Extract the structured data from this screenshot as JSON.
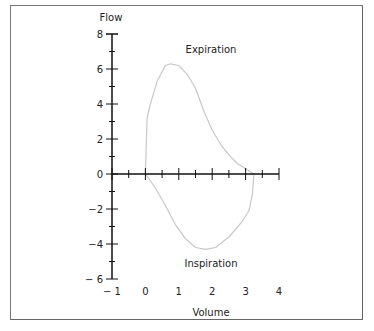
{
  "chart_data": {
    "type": "line",
    "title": "",
    "xlabel": "Volume",
    "ylabel": "Flow",
    "xlim": [
      -1,
      4
    ],
    "ylim": [
      -6,
      8
    ],
    "grid": false,
    "x_ticks": [
      "− 1",
      "0",
      "1",
      "2",
      "3",
      "4"
    ],
    "y_ticks": [
      "8",
      "6",
      "4",
      "2",
      "0",
      "−2",
      "−4",
      "− 6"
    ],
    "annotations": [
      {
        "text": "Expiration",
        "x": 2.0,
        "y": 7.1
      },
      {
        "text": "Inspiration",
        "x": 2.0,
        "y": -5.1
      }
    ],
    "series": [
      {
        "name": "Expiration",
        "x": [
          0.0,
          0.05,
          0.15,
          0.35,
          0.6,
          0.75,
          1.0,
          1.25,
          1.5,
          1.75,
          2.0,
          2.25,
          2.5,
          2.75,
          3.0,
          3.25
        ],
        "y": [
          0.0,
          3.2,
          4.0,
          5.3,
          6.2,
          6.3,
          6.2,
          5.7,
          4.9,
          3.6,
          2.5,
          1.7,
          1.1,
          0.6,
          0.3,
          0.0
        ]
      },
      {
        "name": "Inspiration",
        "x": [
          3.25,
          3.2,
          3.1,
          2.9,
          2.5,
          2.1,
          1.8,
          1.5,
          1.2,
          0.9,
          0.6,
          0.3,
          0.0
        ],
        "y": [
          0.0,
          -1.2,
          -2.1,
          -2.7,
          -3.6,
          -4.2,
          -4.3,
          -4.2,
          -3.7,
          -2.9,
          -1.8,
          -0.8,
          0.0
        ]
      }
    ]
  }
}
